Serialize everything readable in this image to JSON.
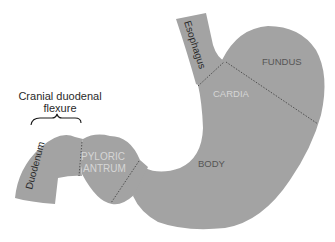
{
  "diagram": {
    "colors": {
      "organ_fill": "#a3a3a3",
      "boundary_line": "#3a3a3a",
      "background": "#ffffff"
    },
    "external_label": {
      "line1": "Cranial duodenal",
      "line2": "flexure"
    },
    "regions": {
      "esophagus": "Esophagus",
      "fundus": "FUNDUS",
      "cardia": "CARDIA",
      "body": "BODY",
      "pyloric_antrum_line1": "PYLORIC",
      "pyloric_antrum_line2": "ANTRUM",
      "duodenum": "Duodenum"
    }
  }
}
